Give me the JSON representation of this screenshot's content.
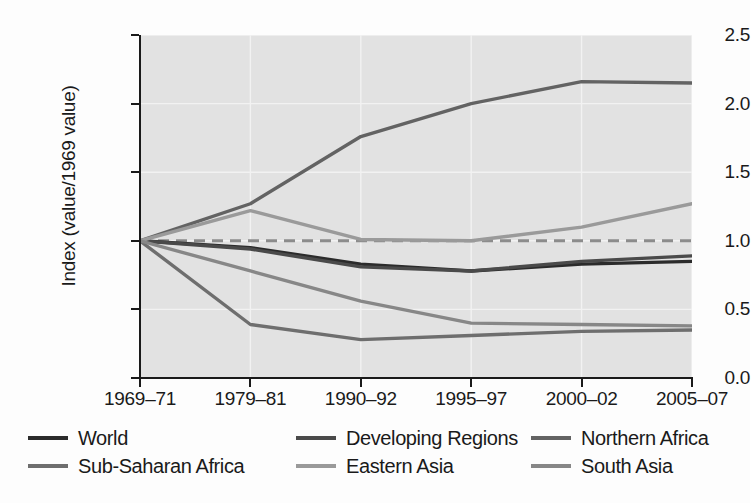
{
  "chart_data": {
    "type": "line",
    "title": "",
    "xlabel": "",
    "ylabel": "Index  (value/1969 value)",
    "categories": [
      "1969–71",
      "1979–81",
      "1990–92",
      "1995–97",
      "2000–02",
      "2005–07"
    ],
    "ylim": [
      0.0,
      2.5
    ],
    "yticks": [
      "0.0",
      "0.5",
      "1.0",
      "1.5",
      "2.0",
      "2.5"
    ],
    "ytick_values": [
      0.0,
      0.5,
      1.0,
      1.5,
      2.0,
      2.5
    ],
    "grid": true,
    "legend_position": "bottom",
    "reference_line": {
      "value": 1.0,
      "style": "dashed",
      "color": "#8c8c8c"
    },
    "plot_background": "#e2e2e2",
    "series": [
      {
        "name": "World",
        "color": "#2b2b2b",
        "values": [
          1.0,
          0.95,
          0.83,
          0.78,
          0.83,
          0.85
        ]
      },
      {
        "name": "Developing Regions",
        "color": "#4a4a4a",
        "values": [
          1.0,
          0.94,
          0.81,
          0.78,
          0.85,
          0.89
        ]
      },
      {
        "name": "Northern Africa",
        "color": "#636363",
        "values": [
          1.0,
          1.27,
          1.76,
          2.0,
          2.16,
          2.15
        ]
      },
      {
        "name": "Sub-Saharan Africa",
        "color": "#6e6e6e",
        "values": [
          1.0,
          0.39,
          0.28,
          0.31,
          0.34,
          0.35
        ]
      },
      {
        "name": "Eastern Asia",
        "color": "#9a9a9a",
        "values": [
          1.0,
          1.22,
          1.01,
          1.0,
          1.1,
          1.27
        ]
      },
      {
        "name": "South Asia",
        "color": "#878787",
        "values": [
          1.0,
          0.78,
          0.56,
          0.4,
          0.39,
          0.38
        ]
      }
    ]
  },
  "legend": {
    "rows": [
      [
        {
          "label": "World",
          "color": "#2b2b2b"
        },
        {
          "label": "Developing Regions",
          "color": "#4a4a4a"
        },
        {
          "label": "Northern Africa",
          "color": "#636363"
        }
      ],
      [
        {
          "label": "Sub-Saharan Africa",
          "color": "#6e6e6e"
        },
        {
          "label": "Eastern Asia",
          "color": "#9a9a9a"
        },
        {
          "label": "South Asia",
          "color": "#878787"
        }
      ]
    ]
  }
}
